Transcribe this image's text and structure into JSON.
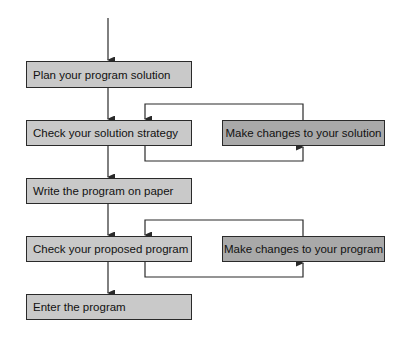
{
  "flowchart": {
    "steps": [
      {
        "label": "Plan your program solution"
      },
      {
        "label": "Check your solution strategy"
      },
      {
        "label": "Write the program on paper"
      },
      {
        "label": "Check your proposed program"
      },
      {
        "label": "Enter the program"
      }
    ],
    "side_steps": [
      {
        "label": "Make changes to your solution"
      },
      {
        "label": "Make changes to your program"
      }
    ],
    "colors": {
      "main_fill": "#c9c9c9",
      "side_fill": "#a9a9a9",
      "line": "#2a2a2a",
      "text": "#111111"
    }
  }
}
